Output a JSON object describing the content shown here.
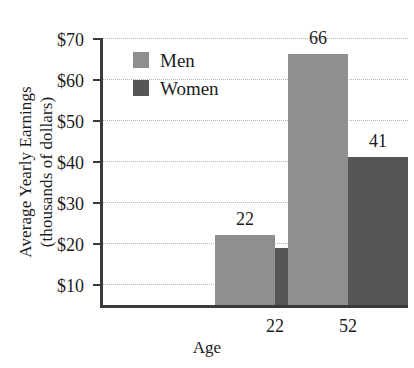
{
  "chart_data": {
    "type": "bar",
    "title": "",
    "xlabel": "Age",
    "ylabel_line1": "Average Yearly Earnings",
    "ylabel_line2": "(thousands of dollars)",
    "categories": [
      "22",
      "52"
    ],
    "series": [
      {
        "name": "Men",
        "color": "#8f8f8f",
        "values": [
          22,
          66
        ],
        "labels": [
          "22",
          "66"
        ]
      },
      {
        "name": "Women",
        "color": "#565656",
        "values": [
          19,
          41
        ],
        "labels": [
          "19",
          "41"
        ]
      }
    ],
    "ylim": [
      5,
      70
    ],
    "yticks": [
      10,
      20,
      30,
      40,
      50,
      60,
      70
    ],
    "ytick_labels": [
      "$10",
      "$20",
      "$30",
      "$40",
      "$50",
      "$60",
      "$70"
    ],
    "grid": true,
    "grid_style": "dotted",
    "legend_position": "top-left-inside"
  }
}
